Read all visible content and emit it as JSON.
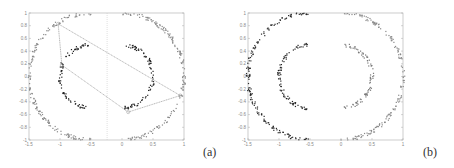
{
  "chart_data": [
    {
      "id": "a",
      "type": "scatter",
      "title": "",
      "panel_label": "(a)",
      "xlabel": "",
      "ylabel": "",
      "xlim": [
        -1.5,
        1
      ],
      "ylim": [
        -1,
        1
      ],
      "xticks": [
        "-1.5",
        "-1",
        "-0.5",
        "0",
        "0.5",
        "1"
      ],
      "xtick_values": [
        -1.5,
        -1,
        -0.5,
        0,
        0.5,
        1
      ],
      "yticks": [
        "1",
        "0.8",
        "0.6",
        "0.4",
        "0.2",
        "0",
        "-0.2",
        "-0.4",
        "-0.6",
        "-0.8",
        "-1"
      ],
      "ytick_values": [
        1,
        0.8,
        0.6,
        0.4,
        0.2,
        0,
        -0.2,
        -0.4,
        -0.6,
        -0.8,
        -1
      ],
      "grid": false,
      "series": [
        {
          "name": "outer-left-half",
          "shape": "arc",
          "center": [
            -0.5,
            0
          ],
          "radius": 1.0,
          "angle_range_deg": [
            90,
            270
          ],
          "color": "#8a8a8a"
        },
        {
          "name": "outer-right-half",
          "shape": "arc",
          "center": [
            0,
            0
          ],
          "radius": 1.0,
          "angle_range_deg": [
            -90,
            90
          ],
          "color": "#8a8a8a"
        },
        {
          "name": "inner-left-arc",
          "shape": "arc",
          "center": [
            -0.5,
            0
          ],
          "radius": 0.5,
          "angle_range_deg": [
            95,
            265
          ],
          "color": "#222222"
        },
        {
          "name": "inner-right-arc",
          "shape": "arc",
          "center": [
            0,
            0
          ],
          "radius": 0.5,
          "angle_range_deg": [
            -85,
            85
          ],
          "color": "#222222"
        }
      ],
      "polygon": {
        "color": "#999999",
        "points": [
          [
            -1.03,
            0.83
          ],
          [
            -0.97,
            0.18
          ],
          [
            0.1,
            -0.56
          ],
          [
            0.94,
            -0.3
          ]
        ],
        "edges": [
          [
            0,
            1
          ],
          [
            1,
            2
          ],
          [
            2,
            3
          ],
          [
            0,
            3
          ]
        ]
      },
      "vline": {
        "x": -0.24,
        "color": "#cccccc"
      }
    },
    {
      "id": "b",
      "type": "scatter",
      "title": "",
      "panel_label": "(b)",
      "xlabel": "",
      "ylabel": "",
      "xlim": [
        -1.5,
        1
      ],
      "ylim": [
        -1,
        1
      ],
      "xticks": [
        "-1.5",
        "-1",
        "-0.5",
        "0",
        "0.5",
        "1"
      ],
      "xtick_values": [
        -1.5,
        -1,
        -0.5,
        0,
        0.5,
        1
      ],
      "yticks": [
        "1",
        "0.8",
        "0.6",
        "0.4",
        "0.2",
        "0",
        "-0.2",
        "-0.4",
        "-0.6",
        "-0.8",
        "-1"
      ],
      "ytick_values": [
        1,
        0.8,
        0.6,
        0.4,
        0.2,
        0,
        -0.2,
        -0.4,
        -0.6,
        -0.8,
        -1
      ],
      "grid": false,
      "series": [
        {
          "name": "cluster-1-outer-left",
          "shape": "arc",
          "center": [
            -0.5,
            0
          ],
          "radius": 1.0,
          "angle_range_deg": [
            90,
            270
          ],
          "color": "#2a2a2a"
        },
        {
          "name": "cluster-2-outer-right",
          "shape": "arc",
          "center": [
            0,
            0
          ],
          "radius": 1.0,
          "angle_range_deg": [
            -90,
            90
          ],
          "color": "#8a8a8a"
        },
        {
          "name": "cluster-1-inner-left",
          "shape": "arc",
          "center": [
            -0.5,
            0
          ],
          "radius": 0.5,
          "angle_range_deg": [
            95,
            265
          ],
          "color": "#222222"
        },
        {
          "name": "cluster-2-inner-right",
          "shape": "arc",
          "center": [
            0,
            0
          ],
          "radius": 0.5,
          "angle_range_deg": [
            -85,
            85
          ],
          "color": "#7a7a7a"
        }
      ]
    }
  ],
  "layout": {
    "panels": [
      {
        "left": 29,
        "top": 13,
        "right": 184,
        "bottom": 140,
        "label_x": 203,
        "label_y": 156
      },
      {
        "left": 248,
        "top": 13,
        "right": 403,
        "bottom": 140,
        "label_x": 423,
        "label_y": 156
      }
    ]
  }
}
